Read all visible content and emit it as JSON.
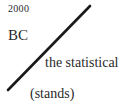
{
  "fragment": {
    "year": "2000",
    "era": "BC",
    "phrase": "the statistical",
    "aside": "(stands)"
  },
  "slash_line": {
    "x1": 8,
    "y1": 90,
    "x2": 90,
    "y2": 6,
    "color": "#1a1a1a",
    "width": 2.6
  }
}
